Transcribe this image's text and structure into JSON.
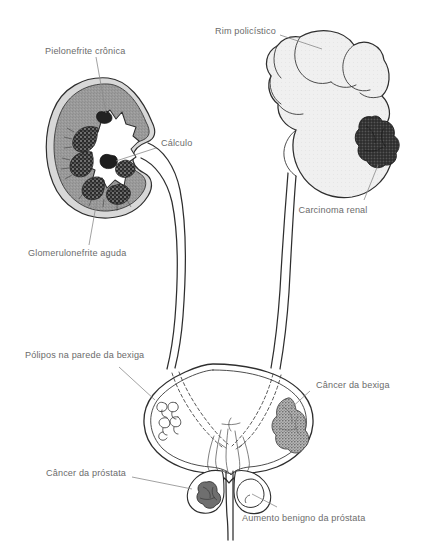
{
  "figure": {
    "language": "pt-BR",
    "background_color": "#ffffff",
    "line_color": "#2e2e2e",
    "label_color": "#6b6b6b",
    "leader_color": "#8a8a8a"
  },
  "labels": {
    "pielonefrite": "Pielonefrite crônica",
    "calculo": "Cálculo",
    "glomerulonefrite": "Glomerulonefrite aguda",
    "rim_policistico": "Rim policístico",
    "carcinoma_renal": "Carcinoma renal",
    "polipos": "Pólipos na parede da bexiga",
    "cancer_bexiga": "Câncer da bexiga",
    "cancer_prostata": "Câncer da próstata",
    "aumento_prostata": "Aumento benigno da próstata"
  },
  "structures": {
    "left_kidney": {
      "name": "Rim esquerdo em corte",
      "cortex_color": "#9a9a9a",
      "pelvis_color": "#ffffff",
      "pyramid_color": "#2b2b2b",
      "capsule_color": "#d8d8d8"
    },
    "right_kidney": {
      "name": "Rim policístico",
      "fill_color": "#f0f0f0"
    },
    "renal_carcinoma": {
      "name": "Massa de carcinoma renal",
      "fill_color": "#3a3a3a"
    },
    "bladder": {
      "name": "Bexiga urinária",
      "fill_color": "#ffffff"
    },
    "bladder_cancer": {
      "name": "Massa de câncer da bexiga",
      "fill_color": "#b5b5b5"
    },
    "prostate_cancer": {
      "name": "Massa de câncer da próstata",
      "fill_color": "#6f6f6f"
    },
    "benign_prostate": {
      "name": "Nódulo benigno da próstata",
      "fill_color": "#ffffff"
    },
    "ureters": {
      "name": "Ureteres",
      "count": 2
    },
    "urethra": {
      "name": "Uretra"
    }
  }
}
